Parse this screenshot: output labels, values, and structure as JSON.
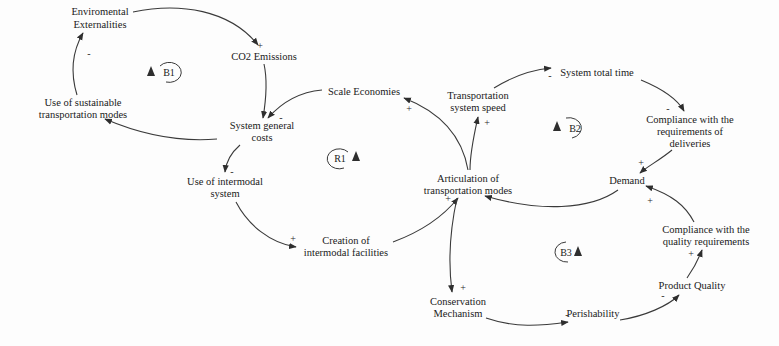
{
  "diagram": {
    "type": "causal-loop-diagram",
    "colors": {
      "line": "#3a3a3a",
      "text": "#1a1a1a",
      "background": "#fdfdfd"
    },
    "nodes": {
      "env_ext": {
        "lines": [
          "Enviromental",
          "Externalities"
        ]
      },
      "co2": {
        "lines": [
          "CO2 Emissions"
        ]
      },
      "sust_modes": {
        "lines": [
          "Use of sustainable",
          "transportation modes"
        ]
      },
      "scale_econ": {
        "lines": [
          "Scale Economies"
        ]
      },
      "sys_costs": {
        "lines": [
          "System general",
          "costs"
        ]
      },
      "trans_speed": {
        "lines": [
          "Transportation",
          "system speed"
        ]
      },
      "total_time": {
        "lines": [
          "System total time"
        ]
      },
      "compl_deliv": {
        "lines": [
          "Compliance with the",
          "requirements of",
          "deliveries"
        ]
      },
      "intermodal": {
        "lines": [
          "Use of intermodal",
          "system"
        ]
      },
      "articulation": {
        "lines": [
          "Articulation of",
          "transportation modes"
        ]
      },
      "demand": {
        "lines": [
          "Demand"
        ]
      },
      "facilities": {
        "lines": [
          "Creation of",
          "intermodal facilities"
        ]
      },
      "compl_quality": {
        "lines": [
          "Compliance with the",
          "quality requirements"
        ]
      },
      "prod_quality": {
        "lines": [
          "Product Quality"
        ]
      },
      "conservation": {
        "lines": [
          "Conservation",
          "Mechanism"
        ]
      },
      "perishability": {
        "lines": [
          "Perishability"
        ]
      }
    },
    "loops": {
      "b1": {
        "label": "B1",
        "type": "balancing"
      },
      "r1": {
        "label": "R1",
        "type": "reinforcing"
      },
      "b2": {
        "label": "B2",
        "type": "balancing"
      },
      "b3": {
        "label": "B3",
        "type": "balancing"
      }
    },
    "links": [
      {
        "from": "Enviromental Externalities",
        "to": "CO2 Emissions",
        "polarity": "+"
      },
      {
        "from": "CO2 Emissions",
        "to": "System general costs",
        "polarity": ""
      },
      {
        "from": "Scale Economies",
        "to": "System general costs",
        "polarity": "-"
      },
      {
        "from": "System general costs",
        "to": "Use of sustainable transportation modes",
        "polarity": ""
      },
      {
        "from": "Use of sustainable transportation modes",
        "to": "Enviromental Externalities",
        "polarity": "-"
      },
      {
        "from": "System general costs",
        "to": "Use of intermodal system",
        "polarity": "-"
      },
      {
        "from": "Use of intermodal system",
        "to": "Creation of intermodal facilities",
        "polarity": "+"
      },
      {
        "from": "Creation of intermodal facilities",
        "to": "Articulation of transportation modes",
        "polarity": "+"
      },
      {
        "from": "Articulation of transportation modes",
        "to": "Scale Economies",
        "polarity": "+"
      },
      {
        "from": "Articulation of transportation modes",
        "to": "Transportation system speed",
        "polarity": "+"
      },
      {
        "from": "Transportation system speed",
        "to": "System total time",
        "polarity": "-"
      },
      {
        "from": "System total time",
        "to": "Compliance with the requirements of deliveries",
        "polarity": "-"
      },
      {
        "from": "Compliance with the requirements of deliveries",
        "to": "Demand",
        "polarity": "+"
      },
      {
        "from": "Demand",
        "to": "Articulation of transportation modes",
        "polarity": ""
      },
      {
        "from": "Articulation of transportation modes",
        "to": "Conservation Mechanism",
        "polarity": "+"
      },
      {
        "from": "Conservation Mechanism",
        "to": "Perishability",
        "polarity": "-"
      },
      {
        "from": "Perishability",
        "to": "Product Quality",
        "polarity": "-"
      },
      {
        "from": "Product Quality",
        "to": "Compliance with the quality requirements",
        "polarity": "+"
      },
      {
        "from": "Compliance with the quality requirements",
        "to": "Demand",
        "polarity": "+"
      }
    ],
    "polarity_marks": {
      "p_co2": "+",
      "p_sust_env": "-",
      "p_costs_from_scale": "-",
      "p_scale_in": "+",
      "p_speed_in": "+",
      "p_time_in": "-",
      "p_deliv_in": "-",
      "p_demand_in_top": "+",
      "p_demand_in_bottom": "+",
      "p_intermodal_in": "-",
      "p_facilities_in": "+",
      "p_artic_in": "+",
      "p_conserv_in": "+",
      "p_perish_in": "-",
      "p_pq_in": "-",
      "p_cq_in": "+"
    }
  }
}
